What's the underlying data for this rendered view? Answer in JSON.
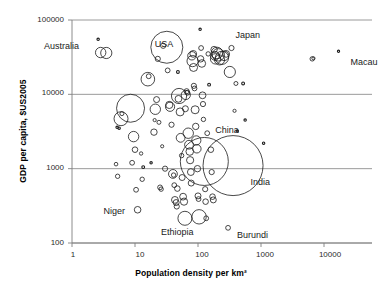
{
  "chart_data": {
    "type": "scatter",
    "title": "",
    "xlabel": "Population density per km²",
    "ylabel": "GDP per capita, $US2005",
    "xscale": "log",
    "yscale": "log",
    "xlim": [
      1,
      30000
    ],
    "ylim": [
      100,
      100000
    ],
    "xticks": [
      "1",
      "10",
      "100",
      "1000",
      "10000"
    ],
    "yticks": [
      "100000",
      "10000",
      "1000",
      "100"
    ],
    "grid": "horizontal",
    "legend": "none",
    "marker": "open-circle-bubble",
    "bubble_meaning": "population",
    "annotations": [
      {
        "label": "Australia",
        "x": 3.0,
        "y": 38000
      },
      {
        "label": "USA",
        "x": 32,
        "y": 43000
      },
      {
        "label": "Japan",
        "x": 340,
        "y": 42000
      },
      {
        "label": "Macau",
        "x": 17000,
        "y": 30000
      },
      {
        "label": "China",
        "x": 140,
        "y": 3000
      },
      {
        "label": "India",
        "x": 380,
        "y": 1000
      },
      {
        "label": "Niger",
        "x": 11,
        "y": 280
      },
      {
        "label": "Ethiopia",
        "x": 62,
        "y": 210
      },
      {
        "label": "Burundi",
        "x": 300,
        "y": 160
      }
    ],
    "points": [
      {
        "x": 2.6,
        "y": 55000,
        "r": 1.2
      },
      {
        "x": 2.85,
        "y": 36500,
        "r": 5.2
      },
      {
        "x": 3.5,
        "y": 36000,
        "r": 5.6
      },
      {
        "x": 6.0,
        "y": 4700,
        "r": 7.0
      },
      {
        "x": 6.2,
        "y": 5500,
        "r": 2.0
      },
      {
        "x": 5.2,
        "y": 3600,
        "r": 1.2
      },
      {
        "x": 5.6,
        "y": 3500,
        "r": 1.2
      },
      {
        "x": 5.0,
        "y": 1150,
        "r": 1.8
      },
      {
        "x": 5.3,
        "y": 790,
        "r": 2.2
      },
      {
        "x": 8.5,
        "y": 6500,
        "r": 14.0
      },
      {
        "x": 9.5,
        "y": 2700,
        "r": 5.2
      },
      {
        "x": 9.0,
        "y": 1200,
        "r": 2.4
      },
      {
        "x": 10.0,
        "y": 1800,
        "r": 2.8
      },
      {
        "x": 10.4,
        "y": 520,
        "r": 2.4
      },
      {
        "x": 11.0,
        "y": 280,
        "r": 3.3
      },
      {
        "x": 12.5,
        "y": 1600,
        "r": 1.7
      },
      {
        "x": 13.0,
        "y": 720,
        "r": 2.2
      },
      {
        "x": 13.5,
        "y": 1050,
        "r": 1.4
      },
      {
        "x": 16.0,
        "y": 16000,
        "r": 6.8
      },
      {
        "x": 16.5,
        "y": 17500,
        "r": 2.4
      },
      {
        "x": 18.0,
        "y": 1200,
        "r": 1.2
      },
      {
        "x": 20.0,
        "y": 3100,
        "r": 3.2
      },
      {
        "x": 20.5,
        "y": 4500,
        "r": 1.6
      },
      {
        "x": 21.0,
        "y": 6300,
        "r": 5.2
      },
      {
        "x": 22.0,
        "y": 8500,
        "r": 3.0
      },
      {
        "x": 23.0,
        "y": 30000,
        "r": 2.6
      },
      {
        "x": 24.0,
        "y": 4200,
        "r": 2.0
      },
      {
        "x": 25.0,
        "y": 560,
        "r": 2.4
      },
      {
        "x": 26.0,
        "y": 530,
        "r": 2.2
      },
      {
        "x": 27.0,
        "y": 2000,
        "r": 1.6
      },
      {
        "x": 28.0,
        "y": 45000,
        "r": 2.6
      },
      {
        "x": 30.0,
        "y": 1000,
        "r": 2.6
      },
      {
        "x": 32.0,
        "y": 43000,
        "r": 16.0
      },
      {
        "x": 33.0,
        "y": 21000,
        "r": 2.4
      },
      {
        "x": 35.0,
        "y": 7200,
        "r": 3.6
      },
      {
        "x": 36.0,
        "y": 6800,
        "r": 4.6
      },
      {
        "x": 38.0,
        "y": 3900,
        "r": 2.6
      },
      {
        "x": 40.0,
        "y": 850,
        "r": 4.4
      },
      {
        "x": 41.0,
        "y": 820,
        "r": 2.2
      },
      {
        "x": 42.0,
        "y": 600,
        "r": 2.4
      },
      {
        "x": 43.0,
        "y": 380,
        "r": 3.4
      },
      {
        "x": 45.0,
        "y": 350,
        "r": 3.0
      },
      {
        "x": 46.0,
        "y": 310,
        "r": 2.6
      },
      {
        "x": 47.0,
        "y": 540,
        "r": 2.8
      },
      {
        "x": 48.0,
        "y": 20000,
        "r": 1.4
      },
      {
        "x": 49.0,
        "y": 8700,
        "r": 3.4
      },
      {
        "x": 50.0,
        "y": 9500,
        "r": 7.6
      },
      {
        "x": 52.0,
        "y": 5800,
        "r": 4.0
      },
      {
        "x": 53.0,
        "y": 2600,
        "r": 4.4
      },
      {
        "x": 55.0,
        "y": 1500,
        "r": 2.2
      },
      {
        "x": 56.0,
        "y": 760,
        "r": 3.0
      },
      {
        "x": 58.0,
        "y": 420,
        "r": 3.4
      },
      {
        "x": 60.0,
        "y": 360,
        "r": 3.6
      },
      {
        "x": 62.0,
        "y": 215,
        "r": 7.0
      },
      {
        "x": 63.0,
        "y": 6400,
        "r": 3.0
      },
      {
        "x": 64.0,
        "y": 9800,
        "r": 4.6
      },
      {
        "x": 66.0,
        "y": 11000,
        "r": 2.6
      },
      {
        "x": 68.0,
        "y": 10500,
        "r": 2.4
      },
      {
        "x": 70.0,
        "y": 3000,
        "r": 5.2
      },
      {
        "x": 72.0,
        "y": 2100,
        "r": 4.4
      },
      {
        "x": 74.0,
        "y": 1700,
        "r": 3.8
      },
      {
        "x": 75.0,
        "y": 1300,
        "r": 3.6
      },
      {
        "x": 77.0,
        "y": 900,
        "r": 3.4
      },
      {
        "x": 78.0,
        "y": 640,
        "r": 3.0
      },
      {
        "x": 80.0,
        "y": 33000,
        "r": 4.2
      },
      {
        "x": 82.0,
        "y": 28000,
        "r": 5.6
      },
      {
        "x": 84.0,
        "y": 35000,
        "r": 3.4
      },
      {
        "x": 85.0,
        "y": 23000,
        "r": 4.0
      },
      {
        "x": 86.0,
        "y": 13000,
        "r": 2.6
      },
      {
        "x": 88.0,
        "y": 12000,
        "r": 2.4
      },
      {
        "x": 90.0,
        "y": 6200,
        "r": 4.0
      },
      {
        "x": 92.0,
        "y": 3700,
        "r": 3.2
      },
      {
        "x": 94.0,
        "y": 2400,
        "r": 4.6
      },
      {
        "x": 96.0,
        "y": 1850,
        "r": 4.2
      },
      {
        "x": 98.0,
        "y": 1000,
        "r": 3.2
      },
      {
        "x": 100.0,
        "y": 430,
        "r": 3.0
      },
      {
        "x": 102.0,
        "y": 390,
        "r": 2.4
      },
      {
        "x": 104.0,
        "y": 225,
        "r": 7.2
      },
      {
        "x": 108.0,
        "y": 75000,
        "r": 1.2
      },
      {
        "x": 110.0,
        "y": 30000,
        "r": 3.2
      },
      {
        "x": 112.0,
        "y": 42000,
        "r": 2.4
      },
      {
        "x": 115.0,
        "y": 26000,
        "r": 3.8
      },
      {
        "x": 118.0,
        "y": 9700,
        "r": 3.4
      },
      {
        "x": 120.0,
        "y": 7400,
        "r": 2.6
      },
      {
        "x": 122.0,
        "y": 4600,
        "r": 2.2
      },
      {
        "x": 126.0,
        "y": 1250,
        "r": 24.0
      },
      {
        "x": 130.0,
        "y": 530,
        "r": 2.6
      },
      {
        "x": 132.0,
        "y": 360,
        "r": 2.8
      },
      {
        "x": 135.0,
        "y": 215,
        "r": 2.4
      },
      {
        "x": 140.0,
        "y": 3000,
        "r": 2.4
      },
      {
        "x": 145.0,
        "y": 35000,
        "r": 2.2
      },
      {
        "x": 150.0,
        "y": 13500,
        "r": 1.4
      },
      {
        "x": 160.0,
        "y": 1800,
        "r": 2.8
      },
      {
        "x": 165.0,
        "y": 900,
        "r": 2.6
      },
      {
        "x": 170.0,
        "y": 420,
        "r": 2.8
      },
      {
        "x": 175.0,
        "y": 380,
        "r": 3.0
      },
      {
        "x": 180.0,
        "y": 40000,
        "r": 3.2
      },
      {
        "x": 185.0,
        "y": 33000,
        "r": 4.4
      },
      {
        "x": 190.0,
        "y": 30000,
        "r": 5.2
      },
      {
        "x": 200.0,
        "y": 36000,
        "r": 5.8
      },
      {
        "x": 210.0,
        "y": 34000,
        "r": 6.2
      },
      {
        "x": 220.0,
        "y": 29000,
        "r": 5.0
      },
      {
        "x": 240.0,
        "y": 31000,
        "r": 6.6
      },
      {
        "x": 260.0,
        "y": 33000,
        "r": 4.8
      },
      {
        "x": 280.0,
        "y": 35000,
        "r": 3.4
      },
      {
        "x": 300.0,
        "y": 160,
        "r": 2.4
      },
      {
        "x": 320.0,
        "y": 20000,
        "r": 5.6
      },
      {
        "x": 340.0,
        "y": 42000,
        "r": 2.6
      },
      {
        "x": 360.0,
        "y": 1100,
        "r": 30.0
      },
      {
        "x": 380.0,
        "y": 6000,
        "r": 1.6
      },
      {
        "x": 400.0,
        "y": 14000,
        "r": 2.0
      },
      {
        "x": 420.0,
        "y": 3200,
        "r": 1.2
      },
      {
        "x": 520.0,
        "y": 14000,
        "r": 1.4
      },
      {
        "x": 560.0,
        "y": 4500,
        "r": 1.2
      },
      {
        "x": 1100.0,
        "y": 2200,
        "r": 1.2
      },
      {
        "x": 6500.0,
        "y": 30000,
        "r": 2.2
      },
      {
        "x": 6800.0,
        "y": 30500,
        "r": 1.6
      },
      {
        "x": 17000.0,
        "y": 38000,
        "r": 1.1
      }
    ]
  }
}
